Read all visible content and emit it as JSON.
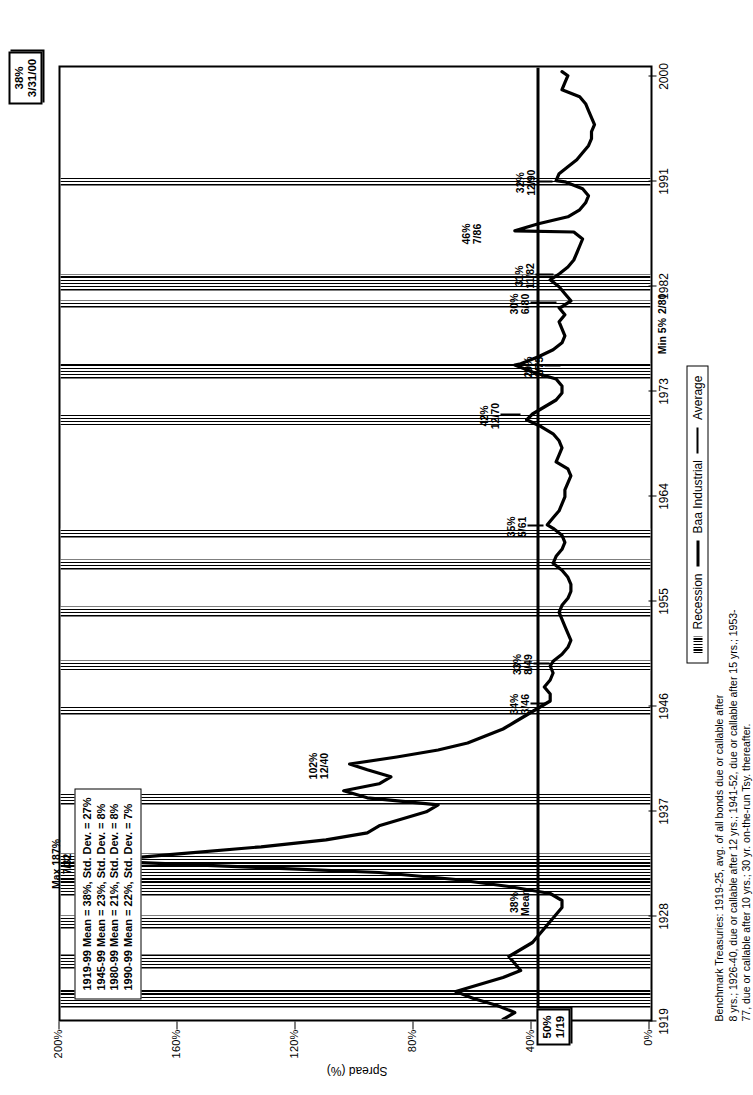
{
  "chart_data": {
    "type": "line",
    "title": "",
    "xlabel": "",
    "ylabel": "Spread (%)",
    "ylim": [
      0,
      200
    ],
    "yticks": [
      "0%",
      "40%",
      "80%",
      "120%",
      "160%",
      "200%"
    ],
    "ytick_values": [
      0,
      40,
      80,
      120,
      160,
      200
    ],
    "xticks": [
      "1919",
      "1928",
      "1937",
      "1946",
      "1955",
      "1964",
      "1973",
      "1982",
      "1991",
      "2000"
    ],
    "xtick_values": [
      1919,
      1928,
      1937,
      1946,
      1955,
      1964,
      1973,
      1982,
      1991,
      2000
    ],
    "grid": false,
    "legend_position": "bottom",
    "legend": [
      "Recession",
      "Baa Industrial",
      "Average"
    ],
    "mean_line_value": 38,
    "series": [
      {
        "name": "Baa Industrial",
        "x": [
          1919.0,
          1919.6,
          1920.2,
          1920.8,
          1921.4,
          1922.0,
          1922.6,
          1923.2,
          1923.8,
          1924.4,
          1925.0,
          1925.6,
          1926.2,
          1926.8,
          1927.4,
          1928.0,
          1928.6,
          1929.2,
          1929.8,
          1930.4,
          1931.0,
          1931.6,
          1932.1,
          1932.6,
          1933.2,
          1933.8,
          1934.4,
          1935.0,
          1935.6,
          1936.2,
          1936.8,
          1937.4,
          1938.0,
          1938.6,
          1939.2,
          1939.8,
          1940.4,
          1940.9,
          1941.5,
          1942.1,
          1942.7,
          1943.3,
          1943.9,
          1944.5,
          1945.1,
          1945.7,
          1946.3,
          1946.9,
          1947.5,
          1948.1,
          1948.7,
          1949.3,
          1949.7,
          1950.3,
          1950.9,
          1951.5,
          1952.1,
          1952.7,
          1953.3,
          1953.9,
          1954.5,
          1955.1,
          1955.7,
          1956.3,
          1956.9,
          1957.5,
          1958.1,
          1958.7,
          1959.3,
          1959.9,
          1960.5,
          1961.1,
          1961.4,
          1962.0,
          1962.6,
          1963.2,
          1963.8,
          1964.4,
          1965.0,
          1965.6,
          1966.2,
          1966.8,
          1967.4,
          1968.0,
          1968.6,
          1969.2,
          1969.8,
          1970.4,
          1970.9,
          1971.5,
          1972.1,
          1972.7,
          1973.3,
          1973.9,
          1974.5,
          1975.1,
          1975.2,
          1975.8,
          1976.4,
          1977.0,
          1977.6,
          1978.2,
          1978.8,
          1979.4,
          1980.0,
          1980.1,
          1980.6,
          1981.2,
          1981.8,
          1982.4,
          1982.9,
          1983.5,
          1984.1,
          1984.7,
          1985.3,
          1985.9,
          1986.5,
          1986.6,
          1987.2,
          1987.8,
          1988.4,
          1989.0,
          1989.6,
          1990.2,
          1990.8,
          1990.9,
          1991.5,
          1992.1,
          1992.7,
          1993.3,
          1993.9,
          1994.5,
          1995.1,
          1995.7,
          1996.3,
          1996.9,
          1997.5,
          1998.1,
          1998.7,
          1999.3,
          1999.9,
          2000.25
        ],
        "y": [
          50,
          46,
          52,
          60,
          66,
          58,
          50,
          44,
          46,
          48,
          44,
          40,
          38,
          36,
          34,
          32,
          30,
          30,
          34,
          48,
          66,
          92,
          140,
          187,
          160,
          132,
          110,
          96,
          92,
          84,
          76,
          72,
          96,
          104,
          92,
          88,
          96,
          102,
          86,
          72,
          62,
          56,
          50,
          46,
          42,
          38,
          34,
          34,
          36,
          34,
          33,
          34,
          33,
          30,
          28,
          27,
          28,
          29,
          30,
          31,
          30,
          28,
          27,
          27,
          28,
          30,
          33,
          32,
          30,
          29,
          30,
          33,
          35,
          33,
          31,
          30,
          29,
          29,
          28,
          27,
          28,
          32,
          31,
          30,
          31,
          33,
          37,
          42,
          40,
          36,
          32,
          30,
          30,
          32,
          40,
          46,
          44,
          38,
          33,
          30,
          29,
          30,
          31,
          29,
          31,
          30,
          27,
          29,
          31,
          34,
          31,
          28,
          26,
          25,
          24,
          23,
          26,
          46,
          38,
          28,
          24,
          22,
          21,
          23,
          29,
          32,
          31,
          28,
          25,
          23,
          21,
          20,
          20,
          19,
          20,
          21,
          22,
          24,
          30,
          29,
          28,
          30
        ],
        "unit": "%"
      }
    ],
    "annotations": [
      {
        "label": "Max 187%",
        "date": "7/32",
        "value": 187,
        "x": 1932.5
      },
      {
        "label": "102%",
        "date": "12/40",
        "value": 102,
        "x": 1940.9
      },
      {
        "label": "34%",
        "date": "3/46",
        "value": 34,
        "x": 1946.2
      },
      {
        "label": "33%",
        "date": "8/49",
        "value": 33,
        "x": 1949.6
      },
      {
        "label": "35%",
        "date": "5/61",
        "value": 35,
        "x": 1961.4
      },
      {
        "label": "42%",
        "date": "12/70",
        "value": 42,
        "x": 1970.9
      },
      {
        "label": "29%",
        "date": "2/75",
        "value": 29,
        "x": 1975.1
      },
      {
        "label": "30%",
        "date": "6/80",
        "value": 30,
        "x": 1980.5
      },
      {
        "label": "31%",
        "date": "11/82",
        "value": 31,
        "x": 1982.9
      },
      {
        "label": "46%",
        "date": "7/86",
        "value": 46,
        "x": 1986.5
      },
      {
        "label": "32%",
        "date": "12/90",
        "value": 32,
        "x": 1990.9
      },
      {
        "label": "Min 5%",
        "date": "2/80",
        "value": 5,
        "x": 1980.1
      }
    ],
    "recession_bands": [
      [
        1920.0,
        1921.6
      ],
      [
        1923.4,
        1924.6
      ],
      [
        1926.8,
        1927.9
      ],
      [
        1929.6,
        1933.2
      ],
      [
        1937.4,
        1938.5
      ],
      [
        1945.1,
        1945.8
      ],
      [
        1948.9,
        1949.8
      ],
      [
        1953.5,
        1954.4
      ],
      [
        1957.6,
        1958.4
      ],
      [
        1960.3,
        1961.1
      ],
      [
        1969.9,
        1970.9
      ],
      [
        1973.9,
        1975.2
      ],
      [
        1980.0,
        1980.6
      ],
      [
        1981.5,
        1982.9
      ],
      [
        1990.5,
        1991.2
      ]
    ]
  },
  "stats_box": {
    "lines": [
      "1919-99 Mean = 38%, Std. Dev. = 27%",
      "1945-99 Mean = 23%, Std. Dev. = 8%",
      "1980-99 Mean = 21%, Std. Dev. = 8%",
      "1990-99 Mean = 22%, Std. Dev. = 7%"
    ]
  },
  "endpoint_boxes": {
    "start": {
      "value": "50%",
      "date": "1/19"
    },
    "end": {
      "value": "38%",
      "date": "3/31/00"
    }
  },
  "mean_marker": {
    "value": "38%",
    "label": "Mean"
  },
  "legend": {
    "items": [
      {
        "label": "Recession",
        "swatch": "hatch-swatch"
      },
      {
        "label": "Baa Industrial",
        "swatch": "thick-line-swatch"
      },
      {
        "label": "Average",
        "swatch": "thin-line-swatch"
      }
    ]
  },
  "footnote": {
    "line1": "Benchmark Treasuries: 1919-25, avg. of all bonds due or callable after",
    "line2": "8 yrs.; 1926-40, due or callable after 12 yrs.; 1941-52, due or callable after 15 yrs.; 1953-",
    "line3": "77, due or callable after 10 yrs.; 30 yr. on-the-run Tsy. thereafter."
  },
  "colors": {
    "ink": "#000000",
    "paper": "#ffffff"
  }
}
